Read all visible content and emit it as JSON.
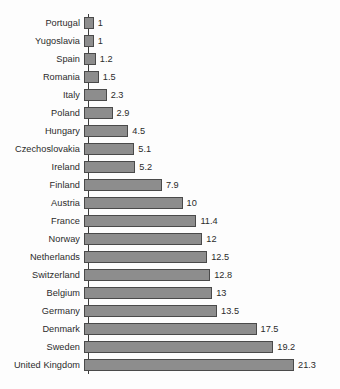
{
  "chart_data": {
    "type": "bar",
    "orientation": "horizontal",
    "title": "",
    "subtitle": "",
    "xlabel": "",
    "ylabel": "",
    "grid": false,
    "legend": null,
    "legend_position": "none",
    "xlim": [
      0,
      21.3
    ],
    "axis_ticks": [],
    "bar_fill_color": "#8d8d8d",
    "bar_border_color": "#4a4a4a",
    "background_color": "#fdfdfd",
    "text_color": "#2b2b2b",
    "value_label_position": "outside-end",
    "sort_order": "ascending",
    "categories": [
      "Portugal",
      "Yugoslavia",
      "Spain",
      "Romania",
      "Italy",
      "Poland",
      "Hungary",
      "Czechoslovakia",
      "Ireland",
      "Finland",
      "Austria",
      "France",
      "Norway",
      "Netherlands",
      "Switzerland",
      "Belgium",
      "Germany",
      "Denmark",
      "Sweden",
      "United Kingdom"
    ],
    "values": [
      1,
      1,
      1.2,
      1.5,
      2.3,
      2.9,
      4.5,
      5.1,
      5.2,
      7.9,
      10,
      11.4,
      12,
      12.5,
      12.8,
      13,
      13.5,
      17.5,
      19.2,
      21.3
    ],
    "value_labels": [
      "1",
      "1",
      "1.2",
      "1.5",
      "2.3",
      "2.9",
      "4.5",
      "5.1",
      "5.2",
      "7.9",
      "10",
      "11.4",
      "12",
      "12.5",
      "12.8",
      "13",
      "13.5",
      "17.5",
      "19.2",
      "21.3"
    ]
  }
}
